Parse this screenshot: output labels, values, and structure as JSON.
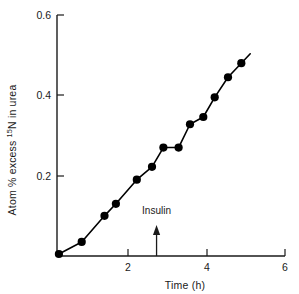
{
  "chart_data": {
    "type": "line",
    "title": "",
    "xlabel": "Time (h)",
    "ylabel": "Atom % excess 15N in urea",
    "ylabel_parts": {
      "prefix": "Atom % excess ",
      "superscript": "15",
      "suffix": "N in urea"
    },
    "xlim": [
      0,
      6
    ],
    "ylim": [
      0,
      0.6
    ],
    "xticks": [
      0,
      2,
      4,
      6
    ],
    "xtick_labels": [
      "",
      "2",
      "4",
      "6"
    ],
    "yticks": [
      0,
      0.2,
      0.4,
      0.6
    ],
    "ytick_labels": [
      "",
      "0.2",
      "0.4",
      "0.6"
    ],
    "grid": false,
    "legend": false,
    "marker": "filled-circle",
    "marker_color": "#000000",
    "line_color": "#000000",
    "series": [
      {
        "name": "Atom % excess 15N in urea",
        "x": [
          0.05,
          0.65,
          1.25,
          1.55,
          2.1,
          2.5,
          2.8,
          3.2,
          3.5,
          3.85,
          4.15,
          4.5,
          4.85
        ],
        "y": [
          0.005,
          0.035,
          0.1,
          0.13,
          0.19,
          0.222,
          0.27,
          0.27,
          0.328,
          0.346,
          0.395,
          0.445,
          0.48
        ]
      }
    ],
    "annotations": [
      {
        "text": "Insulin",
        "type": "arrow-up",
        "x": 2.62,
        "label_y": 0.105,
        "arrow_tip_y": 0.072,
        "arrow_base_y": 0.0
      }
    ]
  }
}
